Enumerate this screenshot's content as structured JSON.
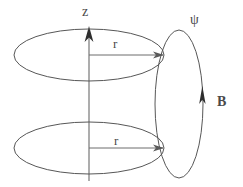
{
  "figure": {
    "background_color": "#ffffff",
    "stroke_color": "#555555",
    "label_color": "#4a4a4a"
  },
  "labels": {
    "z_axis": "z",
    "psi": "ψ",
    "b_field": "B",
    "radius_top": "r",
    "radius_bottom": "r"
  },
  "geometry": {
    "top_loop": {
      "name": "top-circular-loop",
      "center_x": 89,
      "center_y": 55,
      "radius_x": 75,
      "radius_y": 26
    },
    "bottom_loop": {
      "name": "bottom-circular-loop",
      "center_x": 89,
      "center_y": 148,
      "radius_x": 75,
      "radius_y": 26
    },
    "flux_loop": {
      "name": "flux-surface-loop",
      "center_x": 179,
      "center_y": 104,
      "radius_x": 24,
      "radius_y": 74
    },
    "z_axis": {
      "x": 89,
      "y_top": 28,
      "y_bottom": 181
    },
    "radius_top_line": {
      "x_start": 89,
      "x_end": 164,
      "y": 55
    },
    "radius_bottom_line": {
      "x_start": 89,
      "x_end": 164,
      "y": 148
    },
    "b_arrow": {
      "x": 201,
      "y_tail": 125,
      "y_head": 88
    }
  },
  "icons": {
    "z_axis_arrow": "arrow-up-icon",
    "radius_arrow_top": "arrow-right-icon",
    "radius_arrow_bottom": "arrow-right-icon",
    "b_field_arrow": "arrow-up-icon"
  }
}
